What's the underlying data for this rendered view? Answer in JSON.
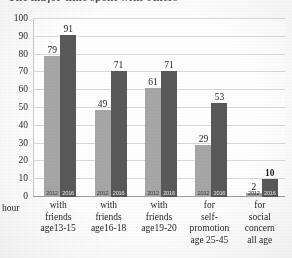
{
  "title_clipped": "The major time spent with others",
  "axis_unit_label": "hour",
  "colors": {
    "series_2012": "#a6a6a6",
    "series_2016": "#595959",
    "gridline": "#d9d9d9",
    "background": "#ffffff"
  },
  "chart_data": {
    "type": "bar",
    "title": "The major time spent with others",
    "xlabel": "",
    "ylabel": "hour",
    "ylim": [
      0,
      100
    ],
    "ytick_step": 10,
    "yticks": [
      "0",
      "10",
      "20",
      "30",
      "40",
      "50",
      "60",
      "70",
      "80",
      "90",
      "100"
    ],
    "grid": true,
    "legend": "in-bar labels",
    "categories": [
      "with friends age13-15",
      "with friends age16-18",
      "with friends age19-20",
      "for self-promotion age 25-45",
      "for social concern all age"
    ],
    "category_lines": [
      [
        "with",
        "friends",
        "age13-15"
      ],
      [
        "with",
        "friends",
        "age16-18"
      ],
      [
        "with",
        "friends",
        "age19-20"
      ],
      [
        "for",
        "self-",
        "promotion",
        "age 25-45"
      ],
      [
        "for",
        "social",
        "concern",
        "all age"
      ]
    ],
    "series": [
      {
        "name": "2012",
        "color": "#a6a6a6",
        "values": [
          79,
          49,
          61,
          29,
          2
        ]
      },
      {
        "name": "2016",
        "color": "#595959",
        "values": [
          91,
          71,
          71,
          53,
          10
        ]
      }
    ],
    "data_labels": {
      "2012": [
        "79",
        "49",
        "61",
        "29",
        "2"
      ],
      "2016": [
        "91",
        "71",
        "71",
        "53",
        "10"
      ]
    },
    "bold_labels": [
      "10"
    ]
  }
}
